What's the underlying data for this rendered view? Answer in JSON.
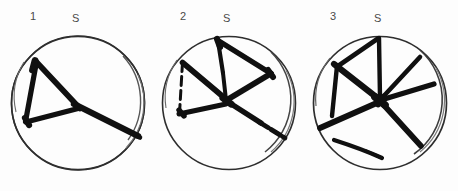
{
  "figure": {
    "name": "incised-circle-marks-plate",
    "background_color": "#fdfdfd",
    "ink_color": "#111111",
    "circle_stroke_color": "#3a3a3a",
    "width": 458,
    "height": 191
  },
  "panels": [
    {
      "number": "1",
      "orientation_label": "S",
      "number_x": 30,
      "number_y": 12,
      "orient_x": 72,
      "orient_y": 14,
      "circle": {
        "cx": 78,
        "cy": 103,
        "r_outer": 67,
        "r_inner": 64
      },
      "mark_description": "triangle with long trailing stroke to lower right"
    },
    {
      "number": "2",
      "orientation_label": "S",
      "number_x": 180,
      "number_y": 12,
      "orient_x": 223,
      "orient_y": 14,
      "circle": {
        "cx": 229,
        "cy": 103,
        "r_outer": 67,
        "r_inner": 64
      },
      "mark_description": "bowtie of two opposed triangles with central vertical stroke and trailing stroke to lower right"
    },
    {
      "number": "3",
      "orientation_label": "S",
      "number_x": 331,
      "number_y": 12,
      "orient_x": 374,
      "orient_y": 14,
      "circle": {
        "cx": 380,
        "cy": 103,
        "r_outer": 67,
        "r_inner": 64
      },
      "mark_description": "six radiating strokes from a central hub with a separate curved stroke at lower left"
    }
  ]
}
